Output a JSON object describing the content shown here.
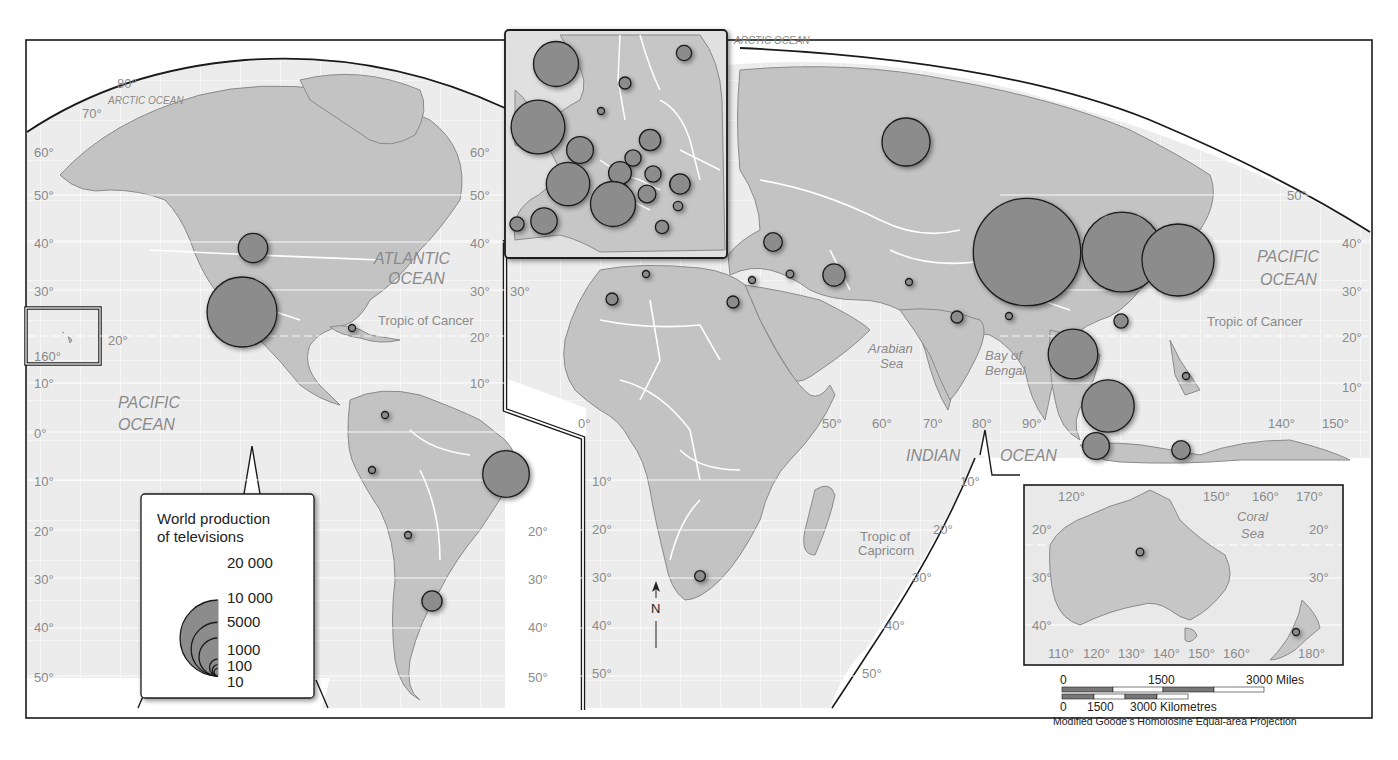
{
  "map": {
    "title": "World production of televisions",
    "projection": "Modified Goode's Homolosine Equal-area Projection",
    "colors": {
      "land": "#c4c4c4",
      "ocean": "#ebebeb",
      "bubble": "#8c8c8c",
      "border": "#ffffff",
      "frame": "#1a1a1a"
    }
  },
  "legend": {
    "title_line1": "World production",
    "title_line2": "of televisions",
    "values": [
      "20 000",
      "10 000",
      "5000",
      "1000",
      "100",
      "10"
    ],
    "value_numbers": [
      20000,
      10000,
      5000,
      1000,
      100,
      10
    ]
  },
  "scale_bar": {
    "miles": {
      "labels": [
        "0",
        "1500",
        "3000 Miles"
      ]
    },
    "km": {
      "labels": [
        "0",
        "1500",
        "3000 Kilometres"
      ]
    }
  },
  "labels": {
    "oceans": [
      {
        "id": "arctic-ocean-west",
        "text": "ARCTIC OCEAN"
      },
      {
        "id": "arctic-ocean-east",
        "text": "ARCTIC OCEAN"
      },
      {
        "id": "atlantic-ocean-1",
        "text": "ATLANTIC"
      },
      {
        "id": "atlantic-ocean-2",
        "text": "OCEAN"
      },
      {
        "id": "pacific-ocean-west-1",
        "text": "PACIFIC"
      },
      {
        "id": "pacific-ocean-west-2",
        "text": "OCEAN"
      },
      {
        "id": "pacific-ocean-east-1",
        "text": "PACIFIC"
      },
      {
        "id": "pacific-ocean-east-2",
        "text": "OCEAN"
      },
      {
        "id": "indian-ocean-1",
        "text": "INDIAN"
      },
      {
        "id": "indian-ocean-2",
        "text": "OCEAN"
      }
    ],
    "seas": [
      {
        "id": "arabian-sea-1",
        "text": "Arabian"
      },
      {
        "id": "arabian-sea-2",
        "text": "Sea"
      },
      {
        "id": "bay-of-bengal-1",
        "text": "Bay of"
      },
      {
        "id": "bay-of-bengal-2",
        "text": "Bengal"
      },
      {
        "id": "coral-sea-1",
        "text": "Coral"
      },
      {
        "id": "coral-sea-2",
        "text": "Sea"
      }
    ],
    "tropics": {
      "cancer_west": "Tropic of Cancer",
      "cancer_east": "Tropic of Cancer",
      "capricorn_1": "Tropic of",
      "capricorn_2": "Capricorn"
    },
    "north_arrow": "N"
  },
  "graticule_labels": {
    "west_lat": [
      "80°",
      "70°",
      "60°",
      "50°",
      "40°",
      "30°",
      "20°",
      "10°",
      "0°",
      "10°",
      "20°",
      "30°",
      "40°",
      "50°"
    ],
    "west_right_lat": [
      "60°",
      "50°",
      "40°",
      "30°",
      "20°",
      "10°",
      "20°",
      "30°",
      "40°",
      "50°"
    ],
    "hawaii_lon": [
      "20°",
      "160°"
    ],
    "africa_lat": [
      "30°",
      "10°",
      "20°",
      "30°",
      "40°",
      "50°"
    ],
    "africa_lon": [
      "0°",
      "50°",
      "60°",
      "70°",
      "80°",
      "90°"
    ],
    "east_right_lat": [
      "50°",
      "40°",
      "30°",
      "20°",
      "10°",
      "10°",
      "20°",
      "30°",
      "40°",
      "50°"
    ],
    "asia_lon": [
      "140°",
      "150°"
    ],
    "australia_lon_top": [
      "120°",
      "150°",
      "160°",
      "170°"
    ],
    "australia_lon_bottom": [
      "110°",
      "120°",
      "130°",
      "140°",
      "150°",
      "160°",
      "180°"
    ],
    "australia_lat_left": [
      "20°",
      "30°",
      "40°"
    ],
    "australia_lat_right": [
      "20°",
      "30°"
    ]
  },
  "chart_data": {
    "type": "proportional-symbol-map",
    "title": "World production of televisions",
    "legend_values": [
      20000,
      10000,
      5000,
      1000,
      100,
      10
    ],
    "symbols": [
      {
        "region": "United States",
        "value": 3000
      },
      {
        "region": "Mexico",
        "value": 17000
      },
      {
        "region": "Cuba",
        "value": 30
      },
      {
        "region": "Colombia",
        "value": 30
      },
      {
        "region": "Peru",
        "value": 40
      },
      {
        "region": "Chile",
        "value": 10
      },
      {
        "region": "Brazil",
        "value": 7500
      },
      {
        "region": "Argentina",
        "value": 1400
      },
      {
        "region": "Ireland",
        "value": 7000
      },
      {
        "region": "United Kingdom",
        "value": 10000
      },
      {
        "region": "Denmark",
        "value": 20
      },
      {
        "region": "Sweden",
        "value": 500
      },
      {
        "region": "Finland",
        "value": 800
      },
      {
        "region": "Belgium",
        "value": 2500
      },
      {
        "region": "France",
        "value": 6500
      },
      {
        "region": "Spain",
        "value": 2400
      },
      {
        "region": "Portugal",
        "value": 700
      },
      {
        "region": "Germany",
        "value": 1800
      },
      {
        "region": "Czech Republic",
        "value": 900
      },
      {
        "region": "Poland",
        "value": 1600
      },
      {
        "region": "Switzerland/Austria",
        "value": 1100
      },
      {
        "region": "Italy",
        "value": 7000
      },
      {
        "region": "Hungary",
        "value": 1200
      },
      {
        "region": "Slovakia",
        "value": 900
      },
      {
        "region": "Romania",
        "value": 1400
      },
      {
        "region": "Bulgaria",
        "value": 300
      },
      {
        "region": "Greece",
        "value": 600
      },
      {
        "region": "Russia",
        "value": 8000
      },
      {
        "region": "Turkey",
        "value": 1200
      },
      {
        "region": "Tunisia",
        "value": 10
      },
      {
        "region": "Algeria",
        "value": 500
      },
      {
        "region": "Egypt",
        "value": 500
      },
      {
        "region": "Israel/Lebanon",
        "value": 150
      },
      {
        "region": "Syria/Iraq",
        "value": 200
      },
      {
        "region": "Iran",
        "value": 1700
      },
      {
        "region": "Pakistan",
        "value": 150
      },
      {
        "region": "India",
        "value": 500
      },
      {
        "region": "Bangladesh",
        "value": 30
      },
      {
        "region": "China",
        "value": 40000
      },
      {
        "region": "South Korea",
        "value": 22000
      },
      {
        "region": "Japan",
        "value": 18000
      },
      {
        "region": "Taiwan/Hong Kong",
        "value": 700
      },
      {
        "region": "Thailand",
        "value": 8500
      },
      {
        "region": "Philippines",
        "value": 100
      },
      {
        "region": "Malaysia",
        "value": 9500
      },
      {
        "region": "Indonesia",
        "value": 2500
      },
      {
        "region": "East Indonesia",
        "value": 1200
      },
      {
        "region": "South Africa",
        "value": 400
      },
      {
        "region": "Australia",
        "value": 200
      },
      {
        "region": "New Zealand",
        "value": 100
      }
    ]
  }
}
